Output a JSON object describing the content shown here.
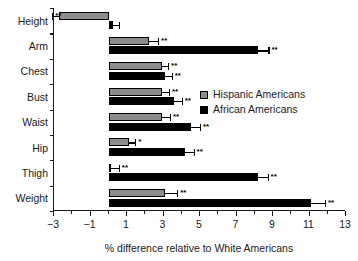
{
  "chart_data": {
    "type": "bar",
    "orientation": "horizontal",
    "title": "",
    "xlabel": "% difference relative to White Americans",
    "ylabel": "",
    "xlim": [
      -3,
      13
    ],
    "xticks": [
      -3,
      -1,
      1,
      3,
      5,
      7,
      9,
      11,
      13
    ],
    "xticklabels": [
      "−3",
      "−1",
      "1",
      "3",
      "5",
      "7",
      "9",
      "11",
      "13"
    ],
    "xminorticks": [
      -2,
      0,
      2,
      4,
      6,
      8,
      10,
      12
    ],
    "grid": false,
    "legend_position": "right-middle",
    "categories": [
      "Height",
      "Arm",
      "Chest",
      "Bust",
      "Waist",
      "Hip",
      "Thigh",
      "Weight"
    ],
    "series": [
      {
        "name": "Hispanic Americans",
        "color": "#8c8c8c",
        "values": [
          -2.75,
          2.2,
          2.9,
          2.9,
          2.9,
          1.1,
          0.1,
          3.1
        ],
        "errors": [
          0.35,
          0.5,
          0.35,
          0.4,
          0.45,
          0.35,
          0.45,
          0.65
        ],
        "significance": [
          "**",
          "**",
          "**",
          "**",
          "**",
          "*",
          "**",
          "**"
        ]
      },
      {
        "name": "African Americans",
        "color": "#000000",
        "values": [
          0.25,
          8.2,
          3.1,
          3.6,
          4.5,
          4.2,
          8.2,
          11.1
        ],
        "errors": [
          0.3,
          0.55,
          0.35,
          0.4,
          0.5,
          0.45,
          0.5,
          0.75
        ],
        "significance": [
          "",
          "**",
          "**",
          "**",
          "**",
          "**",
          "**",
          "**"
        ]
      }
    ]
  },
  "legend": {
    "items": [
      {
        "label": "Hispanic Americans",
        "key": "hispanic"
      },
      {
        "label": "African Americans",
        "key": "african"
      }
    ]
  },
  "colors": {
    "hispanic": "#8c8c8c",
    "african": "#000000",
    "axis": "#1a1a1a",
    "background": "#ffffff"
  }
}
